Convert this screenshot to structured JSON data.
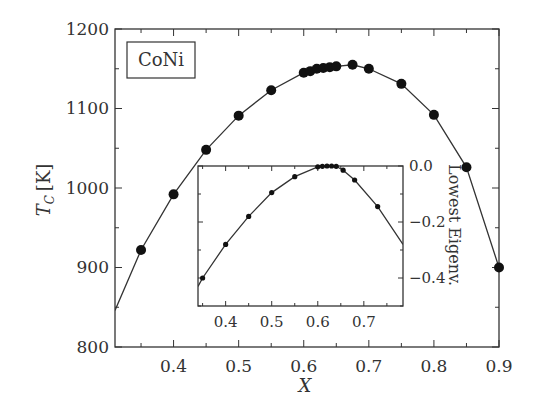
{
  "chart_data": [
    {
      "type": "line",
      "role": "main",
      "title": "",
      "legend_box": "CoNi",
      "xlabel": "X",
      "ylabel": "T_C [K]",
      "xlim": [
        0.31,
        0.9
      ],
      "ylim": [
        800,
        1200
      ],
      "x_ticks": [
        0.4,
        0.5,
        0.6,
        0.7,
        0.8,
        0.9
      ],
      "x_tick_labels": [
        "0.4",
        "0.5",
        "0.6",
        "0.7",
        "0.8",
        "0.9"
      ],
      "y_ticks": [
        800,
        900,
        1000,
        1100,
        1200
      ],
      "y_tick_labels": [
        "800",
        "900",
        "1000",
        "1100",
        "1200"
      ],
      "grid": false,
      "marker": "filled-circle",
      "line_start": {
        "x": 0.31,
        "y": 846
      },
      "series": [
        {
          "name": "CoNi",
          "x": [
            0.35,
            0.4,
            0.45,
            0.5,
            0.55,
            0.6,
            0.61,
            0.62,
            0.63,
            0.64,
            0.65,
            0.675,
            0.7,
            0.75,
            0.8,
            0.85,
            0.9
          ],
          "y": [
            922,
            992,
            1048,
            1091,
            1123,
            1145,
            1147,
            1150,
            1151,
            1152,
            1153,
            1155,
            1150,
            1131,
            1092,
            1026,
            900
          ]
        }
      ]
    },
    {
      "type": "line",
      "role": "inset",
      "title": "",
      "xlabel": "",
      "ylabel": "Lowest Eigenv.",
      "xlim": [
        0.34,
        0.785
      ],
      "ylim": [
        -0.5,
        0.0
      ],
      "x_ticks": [
        0.4,
        0.5,
        0.6,
        0.7
      ],
      "x_tick_labels": [
        "0.4",
        "0.5",
        "0.6",
        "0.7"
      ],
      "y_ticks": [
        0.0,
        -0.2,
        -0.4
      ],
      "y_tick_labels": [
        "0.0",
        "−0.2",
        "−0.4"
      ],
      "y_axis_side": "right",
      "grid": false,
      "marker": "small-filled-circle",
      "line_start": {
        "x": 0.34,
        "y": -0.43
      },
      "line_end": {
        "x": 0.785,
        "y": -0.28
      },
      "series": [
        {
          "name": "Lowest Eigenvalue",
          "x": [
            0.35,
            0.4,
            0.45,
            0.5,
            0.55,
            0.6,
            0.61,
            0.62,
            0.63,
            0.64,
            0.655,
            0.68,
            0.73
          ],
          "y": [
            -0.4,
            -0.28,
            -0.18,
            -0.095,
            -0.038,
            -0.003,
            -0.001,
            0.0,
            0.0,
            -0.001,
            -0.015,
            -0.05,
            -0.145
          ]
        }
      ]
    }
  ],
  "labels": {
    "legend": "CoNi",
    "xlabel": "X",
    "ylabel_main": "T",
    "ylabel_sub": "C",
    "ylabel_unit": "[K]",
    "inset_ylabel": "Lowest Eigenv."
  }
}
